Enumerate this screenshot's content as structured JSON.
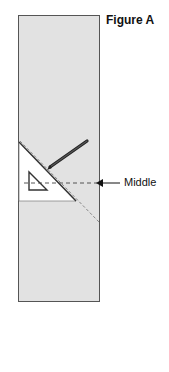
{
  "figure": {
    "title": "Figure A",
    "annotation_label": "Middle",
    "colors": {
      "board": "#e2e2e2",
      "board_border": "#555555",
      "triangle": "#ffffff",
      "pencil": "#333333"
    }
  }
}
